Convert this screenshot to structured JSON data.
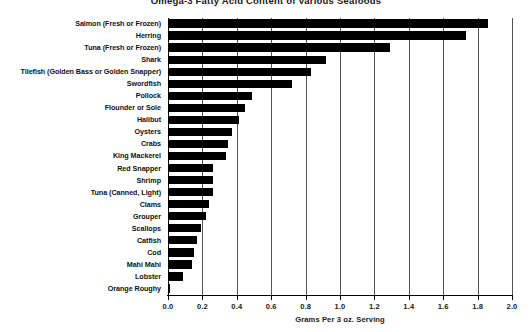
{
  "chart_data": {
    "type": "bar",
    "orientation": "horizontal",
    "title": "Omega-3 Fatty Acid Content of Various Seafoods",
    "xlabel": "Grams Per 3 oz. Serving",
    "ylabel": "",
    "xlim": [
      0.0,
      2.0
    ],
    "xticks": [
      "0.0",
      "0.2",
      "0.4",
      "0.6",
      "0.8",
      "1.0",
      "1.2",
      "1.4",
      "1.6",
      "1.8",
      "2.0"
    ],
    "xtick_values": [
      0.0,
      0.2,
      0.4,
      0.6,
      0.8,
      1.0,
      1.2,
      1.4,
      1.6,
      1.8,
      2.0
    ],
    "grid": "vertical",
    "legend": "none",
    "bar_color": "#000000",
    "background_color": "#ffffff",
    "categories": [
      "Salmon (Fresh or Frozen)",
      "Herring",
      "Tuna (Fresh or Frozen)",
      "Shark",
      "Tilefish (Golden Bass or Golden Snapper)",
      "Swordfish",
      "Pollock",
      "Flounder or Sole",
      "Halibut",
      "Oysters",
      "Crabs",
      "King Mackerel",
      "Red Snapper",
      "Shrimp",
      "Tuna (Canned, Light)",
      "Clams",
      "Grouper",
      "Scallops",
      "Catfish",
      "Cod",
      "Mahi Mahi",
      "Lobster",
      "Orange Roughy"
    ],
    "values": [
      1.86,
      1.73,
      1.29,
      0.92,
      0.83,
      0.72,
      0.49,
      0.45,
      0.41,
      0.37,
      0.35,
      0.34,
      0.26,
      0.26,
      0.26,
      0.24,
      0.22,
      0.19,
      0.17,
      0.15,
      0.14,
      0.09,
      0.01
    ]
  }
}
